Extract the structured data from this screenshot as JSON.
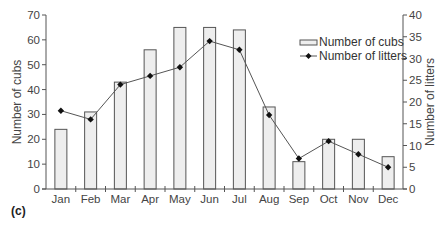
{
  "panel_label": "(c)",
  "chart_data": {
    "type": "bar+line",
    "title": "",
    "categories": [
      "Jan",
      "Feb",
      "Mar",
      "Apr",
      "May",
      "Jun",
      "Jul",
      "Aug",
      "Sep",
      "Oct",
      "Nov",
      "Dec"
    ],
    "series": [
      {
        "name": "Number of cubs",
        "type": "bar",
        "axis": "left",
        "values": [
          24,
          31,
          43,
          56,
          65,
          65,
          64,
          33,
          11,
          20,
          20,
          13
        ],
        "fill": "#eeeeee",
        "stroke": "#555555"
      },
      {
        "name": "Number of litters",
        "type": "line",
        "axis": "right",
        "marker": "diamond",
        "values": [
          18,
          16,
          24,
          26,
          28,
          34,
          32,
          17,
          7,
          11,
          8,
          5
        ],
        "stroke": "#555555",
        "marker_color": "#111111"
      }
    ],
    "xlabel": "",
    "ylabel": "Number of cubs",
    "ylabel_right": "Number of litters",
    "ylim": [
      0,
      70
    ],
    "yticks": [
      0,
      10,
      20,
      30,
      40,
      50,
      60,
      70
    ],
    "ylim_right": [
      0,
      40
    ],
    "yticks_right": [
      0,
      5,
      10,
      15,
      20,
      25,
      30,
      35,
      40
    ],
    "grid": false,
    "legend": {
      "position": "upper right",
      "entries": [
        "Number of cubs",
        "Number of litters"
      ]
    }
  }
}
